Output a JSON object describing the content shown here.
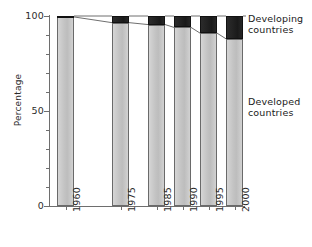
{
  "chart_data": {
    "type": "bar",
    "subtype": "stacked-100-percent",
    "title": "",
    "xlabel": "",
    "ylabel": "Percentage",
    "ylim": [
      0,
      100
    ],
    "yticks": [
      0,
      50,
      100
    ],
    "ytick_labels": [
      "0",
      "50",
      "100"
    ],
    "yminor_ticks": [
      10,
      20,
      30,
      40,
      60,
      70,
      80,
      90
    ],
    "grid": false,
    "legend_position": "right",
    "categories": [
      "1960",
      "1975",
      "1985",
      "1990",
      "1995",
      "2000"
    ],
    "series": [
      {
        "name": "Developed countries",
        "color": "#c6c6c6",
        "values": [
          99.5,
          96.5,
          95.5,
          94.0,
          91.0,
          88.0
        ]
      },
      {
        "name": "Developing countries",
        "color": "#1f1f1f",
        "values": [
          0.5,
          3.5,
          4.5,
          6.0,
          9.0,
          12.0
        ]
      }
    ],
    "annotations": [
      "Leader lines connect the top of the Developed-countries segment between adjacent bars"
    ]
  },
  "axes": {
    "y_title": "Percentage",
    "y_ticks": [
      {
        "label": "100",
        "value": 100
      },
      {
        "label": "50",
        "value": 50
      },
      {
        "label": "0",
        "value": 0
      }
    ],
    "x_ticks": [
      {
        "label": "1960"
      },
      {
        "label": "1975"
      },
      {
        "label": "1985"
      },
      {
        "label": "1990"
      },
      {
        "label": "1995"
      },
      {
        "label": "2000"
      }
    ]
  },
  "legend": {
    "developing": "Developing\ncountries",
    "developed": "Developed\ncountries"
  },
  "colors": {
    "developed_fill": "#c6c6c6",
    "developing_fill": "#1f1f1f",
    "axis": "#6e6e6e",
    "text": "#2b2b2b",
    "background": "#ffffff"
  }
}
